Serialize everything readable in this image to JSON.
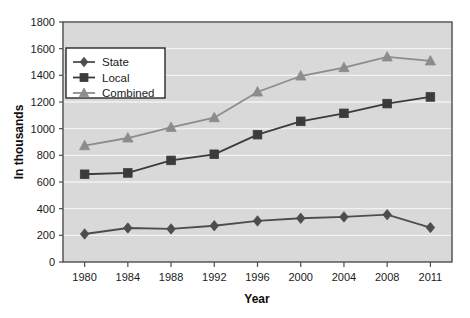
{
  "chart_data": {
    "type": "line",
    "title": "",
    "xlabel": "Year",
    "ylabel": "In thousands",
    "categories": [
      "1980",
      "1984",
      "1988",
      "1992",
      "1996",
      "2000",
      "2004",
      "2008",
      "2011"
    ],
    "ylim": [
      0,
      1800
    ],
    "ytick_step": 200,
    "yticks": [
      "0",
      "200",
      "400",
      "600",
      "800",
      "1000",
      "1200",
      "1400",
      "1600",
      "1800"
    ],
    "grid": true,
    "grid_axis": "y",
    "legend_position": "upper-left-inside",
    "series": [
      {
        "name": "State",
        "marker": "diamond",
        "color": "#4d4d4d",
        "values": [
          210,
          255,
          248,
          272,
          308,
          328,
          338,
          355,
          258
        ]
      },
      {
        "name": "Local",
        "marker": "square",
        "color": "#3b3b3b",
        "values": [
          658,
          668,
          762,
          808,
          955,
          1055,
          1115,
          1188,
          1238
        ]
      },
      {
        "name": "Combined",
        "marker": "triangle",
        "color": "#8c8c8c",
        "values": [
          872,
          930,
          1010,
          1082,
          1275,
          1395,
          1458,
          1538,
          1508
        ]
      }
    ]
  },
  "style": {
    "plot_background": "#d9d9d9",
    "page_background": "#ffffff",
    "gridline_color": "#f2f2f2",
    "frame_color": "#4d4d4d",
    "legend_background": "#ffffff",
    "legend_border": "#1a1a1a"
  }
}
